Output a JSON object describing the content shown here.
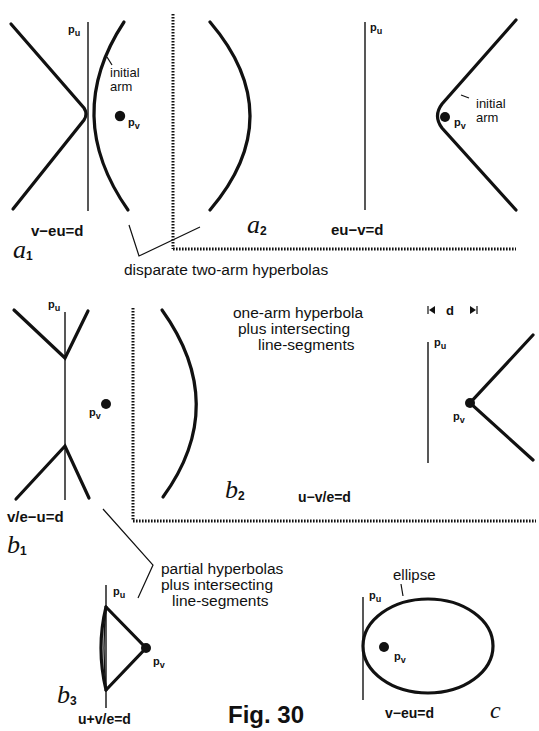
{
  "figure": {
    "title": "Fig. 30",
    "panels": {
      "a1": {
        "panel_label": "a",
        "panel_sub": "1",
        "equation": "v−eu=d",
        "pu": "p",
        "pu_sub": "u",
        "pv": "p",
        "pv_sub": "v",
        "arm_label_1": "initial",
        "arm_label_2": "arm"
      },
      "a2": {
        "panel_label": "a",
        "panel_sub": "2",
        "equation": "eu−v=d",
        "pu": "p",
        "pu_sub": "u",
        "pv": "p",
        "pv_sub": "v",
        "arm_label_1": "initial",
        "arm_label_2": "arm"
      },
      "a_caption": "disparate two-arm hyperbolas",
      "b1": {
        "panel_label": "b",
        "panel_sub": "1",
        "equation": "v/e−u=d",
        "pu": "p",
        "pu_sub": "u",
        "pv": "p",
        "pv_sub": "v"
      },
      "b2": {
        "panel_label": "b",
        "panel_sub": "2",
        "equation": "u−v/e=d",
        "caption_line1": "one-arm hyperbola",
        "caption_line2": "plus intersecting",
        "caption_line3": "line-segments",
        "d_marker": "d",
        "pu": "p",
        "pu_sub": "u",
        "pv": "p",
        "pv_sub": "v"
      },
      "b13_caption": {
        "line1": "partial hyperbolas",
        "line2": "plus intersecting",
        "line3": "line-segments"
      },
      "b3": {
        "panel_label": "b",
        "panel_sub": "3",
        "equation": "u+v/e=d",
        "pu": "p",
        "pu_sub": "u",
        "pv": "p",
        "pv_sub": "v"
      },
      "c": {
        "panel_label": "c",
        "equation": "v−eu=d",
        "curve_label": "ellipse",
        "pu": "p",
        "pu_sub": "u",
        "pv": "p",
        "pv_sub": "v"
      }
    }
  }
}
